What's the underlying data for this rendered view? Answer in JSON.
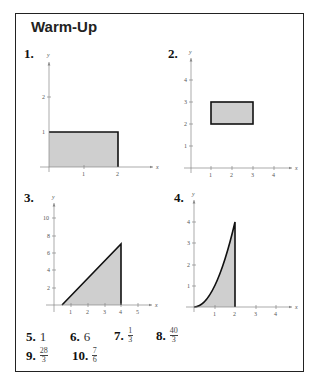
{
  "title": "Warm-Up",
  "problems": [
    {
      "label": "1.",
      "x_ticks": [
        "1",
        "2"
      ],
      "y_ticks": [
        "1",
        "2"
      ],
      "x_axis": "x",
      "y_axis": "y",
      "shape": "rectangle",
      "region": {
        "x": [
          0,
          2
        ],
        "y": [
          0,
          1
        ]
      }
    },
    {
      "label": "2.",
      "x_ticks": [
        "1",
        "2",
        "3",
        "4"
      ],
      "y_ticks": [
        "1",
        "2",
        "3",
        "4"
      ],
      "x_axis": "x",
      "y_axis": "y",
      "shape": "rectangle",
      "region": {
        "x": [
          1,
          3
        ],
        "y": [
          2,
          3
        ]
      }
    },
    {
      "label": "3.",
      "x_ticks": [
        "1",
        "2",
        "3",
        "4",
        "5"
      ],
      "y_ticks": [
        "2",
        "4",
        "6",
        "8",
        "10"
      ],
      "x_axis": "x",
      "y_axis": "y",
      "shape": "triangle",
      "region": {
        "vertices": [
          [
            0.5,
            0
          ],
          [
            4,
            7
          ],
          [
            4,
            0
          ]
        ]
      }
    },
    {
      "label": "4.",
      "x_ticks": [
        "1",
        "2",
        "3",
        "4"
      ],
      "y_ticks": [
        "1",
        "2",
        "3",
        "4"
      ],
      "x_axis": "x",
      "y_axis": "y",
      "shape": "area under y=x^2",
      "region": {
        "x": [
          0,
          2
        ]
      }
    }
  ],
  "answers": [
    {
      "label": "5.",
      "value": "1"
    },
    {
      "label": "6.",
      "value": "6"
    },
    {
      "label": "7.",
      "num": "1",
      "den": "3"
    },
    {
      "label": "8.",
      "num": "40",
      "den": "3"
    },
    {
      "label": "9.",
      "num": "28",
      "den": "3"
    },
    {
      "label": "10.",
      "num": "7",
      "den": "6"
    }
  ],
  "colors": {
    "fill": "#cfcfcf",
    "stroke": "#111111",
    "axis": "#888888"
  }
}
